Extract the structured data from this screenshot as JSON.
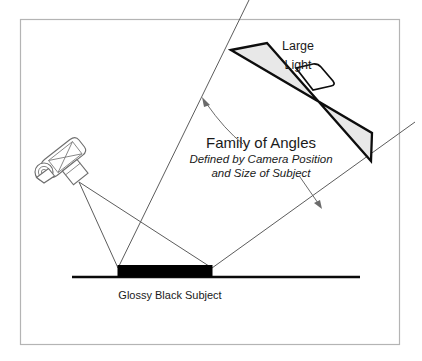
{
  "figure": {
    "title_hidden": "Family of Angles lighting diagram",
    "background_color": "#ffffff",
    "frame_color": "#b4b4b4"
  },
  "labels": {
    "large_light_line1": "Large",
    "large_light_line2": "Light",
    "family_of_angles_title": "Family of Angles",
    "family_of_angles_sub_line1": "Defined by Camera Position",
    "family_of_angles_sub_line2": "and Size of Subject",
    "subject_caption": "Glossy Black Subject"
  },
  "colors": {
    "ray_line": "#5c5c5c",
    "arrow": "#6b6b6b",
    "light_panel_fill": "#e8e8e8",
    "light_panel_stroke": "#0d0d0d",
    "subject_fill": "#000000",
    "ground_line": "#0a0a0a",
    "camera_stroke": "#6e6e6e",
    "text": "#1a1a1a"
  },
  "geometry": {
    "frame": {
      "x": 20,
      "y": 19,
      "width": 380,
      "height": 326
    },
    "ground_line": {
      "x1": 72,
      "y1": 277,
      "x2": 360,
      "y2": 277
    },
    "subject_bar": {
      "x": 118,
      "y": 266,
      "width": 94,
      "height": 11
    },
    "subject_left_edge": {
      "x": 118,
      "y": 266
    },
    "subject_right_edge": {
      "x": 212,
      "y": 266
    },
    "camera_lens_point": {
      "x": 79,
      "y": 182
    },
    "light_panel_corners": [
      {
        "x": 231,
        "y": 50
      },
      {
        "x": 267,
        "y": 43
      },
      {
        "x": 371,
        "y": 161
      },
      {
        "x": 370,
        "y": 133
      }
    ],
    "left_boundary_ray": {
      "x1": 118,
      "y1": 268,
      "x2": 247,
      "y2": 0
    },
    "right_boundary_ray": {
      "x1": 212,
      "y1": 268,
      "x2": 410,
      "y2": 126
    },
    "camera_ray_left": {
      "x1": 79,
      "y1": 182,
      "x2": 118,
      "y2": 268
    },
    "camera_ray_right": {
      "x1": 79,
      "y1": 182,
      "x2": 212,
      "y2": 268
    }
  },
  "icons": {
    "camera": "camera-icon",
    "softbox": "large-light-panel-icon",
    "annotation_arrow_left": "arrow-up-left-icon",
    "annotation_arrow_right": "arrow-down-right-icon"
  }
}
